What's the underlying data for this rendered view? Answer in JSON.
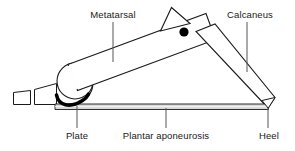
{
  "figure": {
    "background_color": "#ffffff",
    "line_color": "#1a1a1a",
    "fill_color": "#ffffff",
    "accent_color": "#000000",
    "aponeurosis_fill": "#d9d9d9"
  },
  "labels": {
    "metatarsal": "Metatarsal",
    "calcaneus": "Calcaneus",
    "plate": "Plate",
    "plantar_aponeurosis": "Plantar aponeurosis",
    "heel": "Heel"
  },
  "parts": [
    {
      "id": "metatarsal",
      "name": "Metatarsal",
      "label_position": "top-left"
    },
    {
      "id": "calcaneus",
      "name": "Calcaneus",
      "label_position": "top-right"
    },
    {
      "id": "plate",
      "name": "Plate",
      "label_position": "bottom-left"
    },
    {
      "id": "plantar-aponeurosis",
      "name": "Plantar aponeurosis",
      "label_position": "bottom-center"
    },
    {
      "id": "heel",
      "name": "Heel",
      "label_position": "bottom-right"
    }
  ]
}
